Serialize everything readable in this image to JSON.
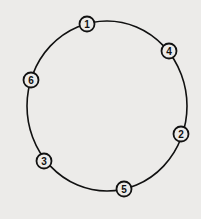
{
  "diagram": {
    "type": "ring",
    "ring": {
      "cx": 107,
      "cy": 106,
      "rx": 80,
      "ry": 85
    },
    "colors": {
      "line": "#111111",
      "node_fill": "#ecebe9",
      "background": "#ecebe9"
    },
    "nodes": [
      {
        "label": "1",
        "x": 87,
        "y": 24
      },
      {
        "label": "4",
        "x": 169,
        "y": 51
      },
      {
        "label": "2",
        "x": 181,
        "y": 134
      },
      {
        "label": "5",
        "x": 124,
        "y": 189
      },
      {
        "label": "3",
        "x": 44,
        "y": 161
      },
      {
        "label": "6",
        "x": 31,
        "y": 80
      }
    ]
  }
}
